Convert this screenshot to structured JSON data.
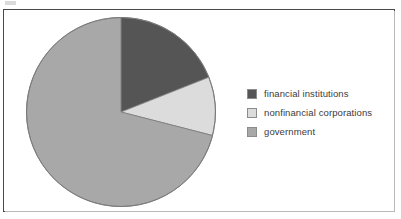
{
  "frame": {
    "border_color": "#4a4a4a",
    "background": "#ffffff"
  },
  "legend": {
    "position": "right",
    "items": [
      {
        "label": "financial institutions",
        "color": "#555555",
        "swatch_name": "legend-swatch-financial-institutions"
      },
      {
        "label": "nonfinancial corporations",
        "color": "#dcdcdc",
        "swatch_name": "legend-swatch-nonfinancial-corporations"
      },
      {
        "label": "government",
        "color": "#a8a8a8",
        "swatch_name": "legend-swatch-government"
      }
    ]
  },
  "chart_data": {
    "type": "pie",
    "title": "",
    "subtitle": "",
    "xlabel": "",
    "ylabel": "",
    "grid": false,
    "legend_position": "right",
    "start_angle_deg": 0,
    "direction": "clockwise",
    "categories": [
      "financial institutions",
      "nonfinancial corporations",
      "government"
    ],
    "values": [
      19,
      10,
      71
    ],
    "value_unit": "percent",
    "colors": [
      "#555555",
      "#dcdcdc",
      "#a8a8a8"
    ],
    "slices": [
      {
        "label": "financial institutions",
        "value": 19,
        "color": "#555555",
        "start_deg": 0,
        "end_deg": 68.4
      },
      {
        "label": "nonfinancial corporations",
        "value": 10,
        "color": "#dcdcdc",
        "start_deg": 68.4,
        "end_deg": 104.4
      },
      {
        "label": "government",
        "value": 71,
        "color": "#a8a8a8",
        "start_deg": 104.4,
        "end_deg": 360
      }
    ]
  }
}
